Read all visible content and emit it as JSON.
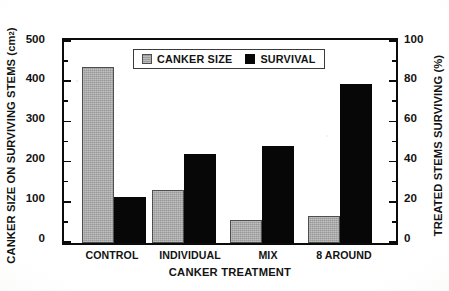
{
  "chart_data": {
    "type": "bar",
    "title": "",
    "xlabel": "CANKER TREATMENT",
    "ylabel": "CANKER SIZE ON SURVIVING STEMS (cm2)",
    "ylabel_right": "TREATED STEMS SURVIVING (%)",
    "categories": [
      "CONTROL",
      "INDIVIDUAL",
      "MIX",
      "8 AROUND"
    ],
    "series": [
      {
        "name": "CANKER SIZE",
        "axis": "left",
        "unit": "cm2",
        "color": "#a8a8a8",
        "values": [
          437,
          132,
          57,
          67
        ]
      },
      {
        "name": "SURVIVAL",
        "axis": "right",
        "unit": "%",
        "color": "#070707",
        "values": [
          23,
          44,
          48,
          79
        ]
      }
    ],
    "ylim": [
      0,
      500
    ],
    "ylim_right": [
      0,
      100
    ],
    "yticks": [
      0,
      100,
      200,
      300,
      400,
      500
    ],
    "yticks_right": [
      0,
      20,
      40,
      60,
      80,
      100
    ],
    "yminorticks": [
      50,
      150,
      250,
      350,
      450
    ],
    "yminorticks_right": [
      10,
      30,
      50,
      70,
      90
    ],
    "grid": false,
    "legend_position": "top-center"
  },
  "axes": {
    "left": {
      "title_prefix": "CANKER SIZE ON SURVIVING STEMS (cm",
      "title_sup": "2",
      "title_suffix": " )",
      "ticklabels": [
        "500",
        "400",
        "300",
        "200",
        "100",
        "0"
      ]
    },
    "right": {
      "title": "TREATED STEMS SURVIVING (%)",
      "ticklabels": [
        "100",
        "80",
        "60",
        "40",
        "20",
        "0"
      ]
    },
    "bottom": {
      "title": "CANKER TREATMENT",
      "ticklabels": [
        "CONTROL",
        "INDIVIDUAL",
        "MIX",
        "8 AROUND"
      ]
    }
  },
  "legend": {
    "items": [
      {
        "label": "CANKER SIZE",
        "swatch": "gray-square-swatch"
      },
      {
        "label": "SURVIVAL",
        "swatch": "black-square-swatch"
      }
    ]
  }
}
